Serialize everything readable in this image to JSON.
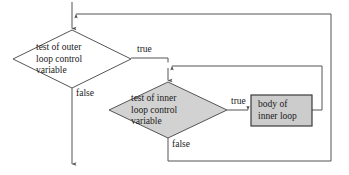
{
  "figure": {
    "width": 349,
    "height": 175,
    "background": "#ffffff"
  },
  "style": {
    "line_color": "#555555",
    "decision_outer_fill": "#ffffff",
    "decision_inner_fill": "#d2d2d2",
    "process_fill": "#cccccc",
    "process_stroke": "#3a3a3a",
    "text_color": "#1a1a1a"
  },
  "nodes": {
    "outer_decision": {
      "shape": "diamond",
      "filled": false,
      "lines": [
        "test of outer",
        "loop control",
        "variable"
      ],
      "text": "test of outer\nloop control\nvariable",
      "cx": 72,
      "cy": 59,
      "rx": 59,
      "ry": 29
    },
    "inner_decision": {
      "shape": "diamond",
      "filled": true,
      "lines": [
        "test of inner",
        "loop control",
        "variable"
      ],
      "text": "test of inner\nloop control\nvariable",
      "cx": 168,
      "cy": 110,
      "rx": 59,
      "ry": 28
    },
    "inner_body": {
      "shape": "rectangle",
      "filled": true,
      "lines": [
        "body of",
        "inner loop"
      ],
      "text": "body of\ninner loop",
      "x": 251,
      "y": 95,
      "w": 61,
      "h": 31
    }
  },
  "edges": {
    "entry": {
      "from": "top",
      "to": "outer_decision",
      "label": ""
    },
    "outer_true": {
      "label": "true",
      "from": "outer_decision",
      "to": "inner_decision"
    },
    "outer_false": {
      "label": "false",
      "from": "outer_decision",
      "to": "exit"
    },
    "inner_true": {
      "label": "true",
      "from": "inner_decision",
      "to": "inner_body"
    },
    "inner_false": {
      "label": "false",
      "from": "inner_decision",
      "to": "outer_loopback"
    },
    "inner_loopback": {
      "label": "",
      "from": "inner_body",
      "to": "inner_decision"
    },
    "outer_loopback": {
      "label": "",
      "from": "inner_false",
      "to": "outer_decision_entry"
    }
  }
}
